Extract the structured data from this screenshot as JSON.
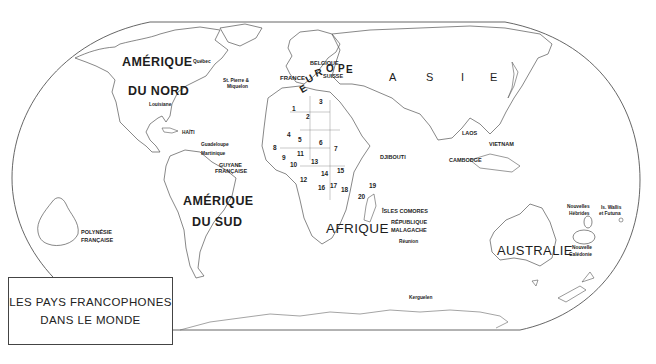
{
  "title": {
    "line1": "LES PAYS FRANCOPHONES",
    "line2": "DANS LE MONDE"
  },
  "continents": {
    "amerique_nord_1": "AMÉRIQUE",
    "amerique_nord_2": "DU NORD",
    "amerique_sud_1": "AMÉRIQUE",
    "amerique_sud_2": "DU SUD",
    "afrique": "AFRIQUE",
    "australie": "AUSTRALIE",
    "europe_letters": [
      "E",
      "U",
      "R",
      "O",
      "P",
      "E"
    ],
    "asie_letters": [
      "A",
      "S",
      "I",
      "E"
    ]
  },
  "places": {
    "quebec": "Québec",
    "st_pierre": "St. Pierre &",
    "miquelon": "Miquelon",
    "louisiane": "Louisiane",
    "haiti": "HAÏTI",
    "guadeloupe": "Guadeloupe",
    "martinique": "Martinique",
    "guyane_1": "GUYANE",
    "guyane_2": "FRANÇAISE",
    "france": "FRANCE",
    "belgique": "BELGIQUE",
    "suisse": "SUISSE",
    "djibouti": "DJIBOUTI",
    "laos": "LAOS",
    "vietnam": "VIETNAM",
    "cambodge": "CAMBODGE",
    "comores": "ÎSLES COMORES",
    "madagascar_1": "RÉPUBLIQUE",
    "madagascar_2": "MALAGACHE",
    "reunion": "Réunion",
    "kerguelen": "Kerguelen",
    "hebrides_1": "Nouvelles",
    "hebrides_2": "Hébrides",
    "wallis_1": "Is. Wallis",
    "wallis_2": "et Futuna",
    "caledonie_1": "Nouvelle",
    "caledonie_2": "Calédonie",
    "polynesie_1": "POLYNÉSIE",
    "polynesie_2": "FRANÇAISE"
  },
  "africa_numbers": [
    "1",
    "2",
    "3",
    "4",
    "5",
    "6",
    "7",
    "8",
    "9",
    "10",
    "11",
    "12",
    "13",
    "14",
    "15",
    "16",
    "17",
    "18",
    "19",
    "20"
  ]
}
